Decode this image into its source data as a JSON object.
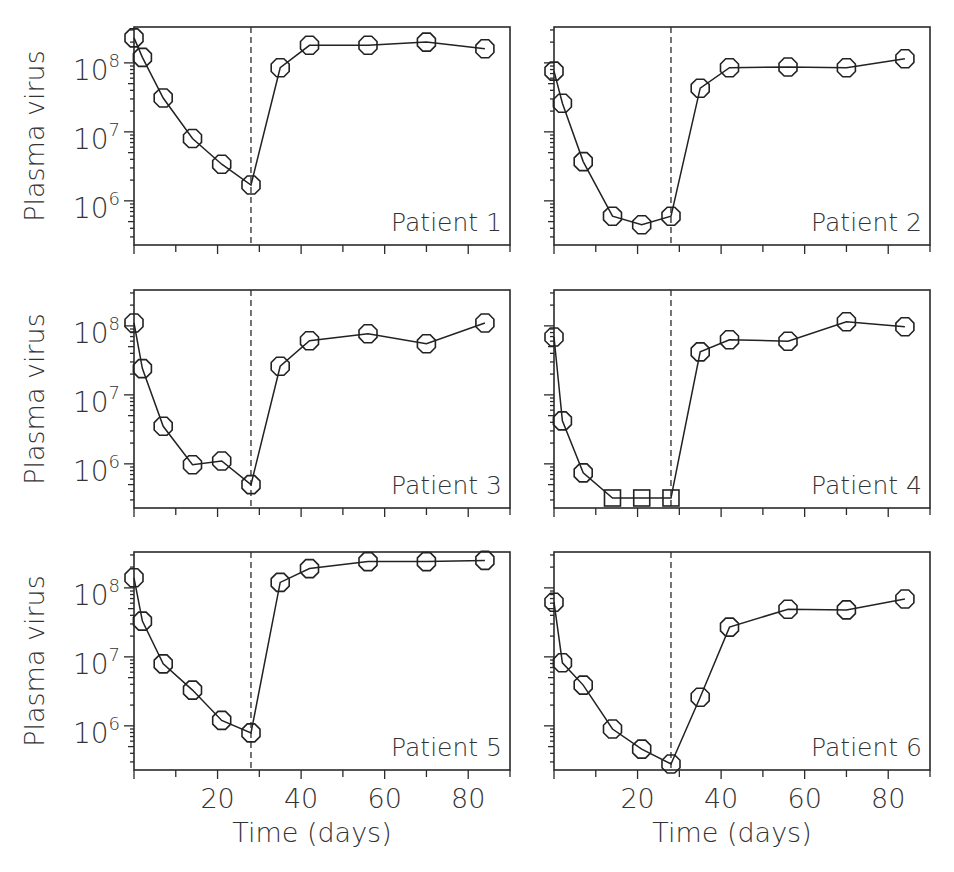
{
  "figure": {
    "ylabel": "Plasma virus",
    "xlabel": "Time (days)",
    "x_tick_labels": [
      "20",
      "40",
      "60",
      "80"
    ],
    "y_tick_labels": [
      {
        "base": "10",
        "exp": "8"
      },
      {
        "base": "10",
        "exp": "7"
      },
      {
        "base": "10",
        "exp": "6"
      }
    ],
    "treatment_stop_day": 28
  },
  "chart_data": {
    "type": "line",
    "title": "",
    "xlabel": "Time (days)",
    "ylabel": "Plasma virus",
    "yscale": "log",
    "xlim": [
      0,
      90
    ],
    "x_ticks": [
      0,
      10,
      20,
      30,
      40,
      50,
      60,
      70,
      80,
      90
    ],
    "x_tick_labels": [
      "20",
      "40",
      "60",
      "80"
    ],
    "y_major_ticks": [
      1000000.0,
      10000000.0,
      100000000.0
    ],
    "grid": false,
    "reference_line": {
      "type": "vertical",
      "style": "dashed",
      "x": 28
    },
    "marker_legend": {
      "octagon": "measured value",
      "square": "below detection limit"
    },
    "panels": [
      {
        "title": "Patient 1",
        "x": [
          0,
          2,
          7,
          14,
          21,
          28,
          35,
          42,
          56,
          70,
          84
        ],
        "values": [
          230000000.0,
          120000000.0,
          31000000.0,
          8000000.0,
          3400000.0,
          1700000.0,
          85000000.0,
          180000000.0,
          180000000.0,
          200000000.0,
          160000000.0
        ],
        "markers": [
          "o",
          "o",
          "o",
          "o",
          "o",
          "o",
          "o",
          "o",
          "o",
          "o",
          "o"
        ]
      },
      {
        "title": "Patient 2",
        "x": [
          0,
          2,
          7,
          14,
          21,
          28,
          35,
          42,
          56,
          70,
          84
        ],
        "values": [
          76000000.0,
          26000000.0,
          3700000.0,
          600000.0,
          450000.0,
          600000.0,
          43000000.0,
          85000000.0,
          87000000.0,
          85000000.0,
          115000000.0
        ],
        "markers": [
          "o",
          "o",
          "o",
          "o",
          "o",
          "o",
          "o",
          "o",
          "o",
          "o",
          "o"
        ]
      },
      {
        "title": "Patient 3",
        "x": [
          0,
          2,
          7,
          14,
          21,
          28,
          35,
          42,
          56,
          70,
          84
        ],
        "values": [
          110000000.0,
          24000000.0,
          3500000.0,
          970000.0,
          1100000.0,
          500000.0,
          26000000.0,
          61000000.0,
          77000000.0,
          55000000.0,
          110000000.0
        ],
        "markers": [
          "o",
          "o",
          "o",
          "o",
          "o",
          "o",
          "o",
          "o",
          "o",
          "o",
          "o"
        ]
      },
      {
        "title": "Patient 4",
        "x": [
          0,
          2,
          7,
          14,
          21,
          28,
          35,
          42,
          56,
          70,
          84
        ],
        "values": [
          69000000.0,
          4200000.0,
          740000.0,
          320000.0,
          320000.0,
          320000.0,
          42000000.0,
          63000000.0,
          60000000.0,
          115000000.0,
          97000000.0
        ],
        "markers": [
          "o",
          "o",
          "o",
          "s",
          "s",
          "s",
          "o",
          "o",
          "o",
          "o",
          "o"
        ]
      },
      {
        "title": "Patient 5",
        "x": [
          0,
          2,
          7,
          14,
          21,
          28,
          35,
          42,
          56,
          70,
          84
        ],
        "values": [
          140000000.0,
          33000000.0,
          7900000.0,
          3300000.0,
          1200000.0,
          790000.0,
          120000000.0,
          190000000.0,
          240000000.0,
          240000000.0,
          250000000.0
        ],
        "markers": [
          "o",
          "o",
          "o",
          "o",
          "o",
          "o",
          "o",
          "o",
          "o",
          "o",
          "o"
        ]
      },
      {
        "title": "Patient 6",
        "x": [
          0,
          2,
          7,
          14,
          21,
          28,
          35,
          42,
          56,
          70,
          84
        ],
        "values": [
          62000000.0,
          8200000.0,
          3900000.0,
          900000.0,
          460000.0,
          280000.0,
          2600000.0,
          27000000.0,
          49000000.0,
          48000000.0,
          69000000.0
        ],
        "markers": [
          "o",
          "o",
          "o",
          "o",
          "o",
          "o",
          "o",
          "o",
          "o",
          "o",
          "o"
        ]
      }
    ]
  }
}
